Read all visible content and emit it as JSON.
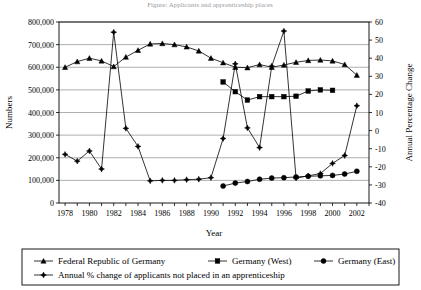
{
  "chart_data": {
    "type": "line",
    "title": "Figure: Applicants and apprenticeship places",
    "xlabel": "Year",
    "ylabel": "Numbers",
    "y2label": "Annual Percentage Change",
    "grid": true,
    "legend_position": "bottom",
    "xlim": [
      1977.5,
      2003.0
    ],
    "ylim": [
      0,
      800000
    ],
    "y2lim": [
      -40,
      60
    ],
    "x": [
      1978,
      1979,
      1980,
      1981,
      1982,
      1983,
      1984,
      1985,
      1986,
      1987,
      1988,
      1989,
      1990,
      1991,
      1992,
      1993,
      1994,
      1995,
      1996,
      1997,
      1998,
      1999,
      2000,
      2001,
      2002
    ],
    "xtick_labels": [
      "1978",
      "1980",
      "1982",
      "1984",
      "1986",
      "1988",
      "1990",
      "1992",
      "1994",
      "1996",
      "1998",
      "2000",
      "2002"
    ],
    "ytick_labels": [
      "0",
      "100,000",
      "200,000",
      "300,000",
      "400,000",
      "500,000",
      "600,000",
      "700,000",
      "800,000"
    ],
    "y2tick_labels": [
      "-40",
      "-30",
      "-20",
      "-10",
      "0",
      "10",
      "20",
      "30",
      "40",
      "50",
      "60"
    ],
    "series": [
      {
        "name": "Federal Republic of Germany",
        "marker": "triangle",
        "axis": "left",
        "x": [
          1978,
          1979,
          1980,
          1981,
          1982,
          1983,
          1984,
          1985,
          1986,
          1987,
          1988,
          1989,
          1990,
          1991,
          1992,
          1993,
          1994,
          1995,
          1996,
          1997,
          1998,
          1999,
          2000,
          2001,
          2002
        ],
        "values": [
          600000,
          625000,
          640000,
          628000,
          603000,
          645000,
          675000,
          703000,
          705000,
          700000,
          690000,
          672000,
          640000,
          620000,
          600000,
          598000,
          612000,
          600000,
          610000,
          622000,
          630000,
          632000,
          628000,
          612000,
          565000
        ]
      },
      {
        "name": "Germany (West)",
        "marker": "square",
        "axis": "left",
        "x": [
          1991,
          1992,
          1993,
          1994,
          1995,
          1996,
          1997,
          1998,
          1999,
          2000
        ],
        "values": [
          535000,
          492000,
          455000,
          470000,
          470000,
          470000,
          472000,
          495000,
          500000,
          498000
        ]
      },
      {
        "name": "Germany (East)",
        "marker": "circle",
        "axis": "left",
        "x": [
          1991,
          1992,
          1993,
          1994,
          1995,
          1996,
          1997,
          1998,
          1999,
          2000,
          2001,
          2002
        ],
        "values": [
          75000,
          88000,
          95000,
          105000,
          110000,
          112000,
          115000,
          118000,
          120000,
          122000,
          128000,
          140000
        ]
      },
      {
        "name": "Annual % change of applicants not placed in an apprenticeship",
        "marker": "star",
        "axis": "left_scaled",
        "x": [
          1978,
          1979,
          1980,
          1981,
          1982,
          1983,
          1984,
          1985,
          1986,
          1987,
          1988,
          1989,
          1990,
          1991,
          1992,
          1993,
          1994,
          1995,
          1996,
          1997,
          1998,
          1999,
          2000,
          2001,
          2002
        ],
        "values": [
          215000,
          185000,
          230000,
          150000,
          755000,
          330000,
          250000,
          98000,
          100000,
          100000,
          103000,
          105000,
          112000,
          285000,
          615000,
          332000,
          245000,
          605000,
          760000,
          110000,
          120000,
          130000,
          175000,
          210000,
          430000
        ]
      }
    ],
    "legend": [
      {
        "label": "Federal Republic of Germany",
        "marker": "triangle"
      },
      {
        "label": "Germany (West)",
        "marker": "square"
      },
      {
        "label": "Germany (East)",
        "marker": "circle"
      },
      {
        "label": "Annual % change of applicants not placed in an apprenticeship",
        "marker": "star"
      }
    ]
  }
}
